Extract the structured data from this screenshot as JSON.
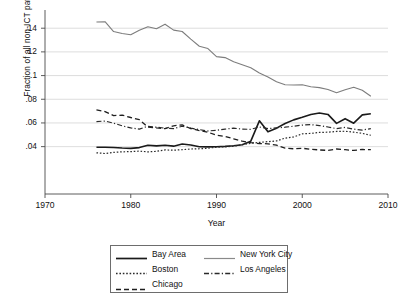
{
  "chart_data": {
    "type": "line",
    "title": "",
    "subtitle": "",
    "xlabel": "Year",
    "ylabel": "Fraction of all non-ICT patents in location",
    "xlim": [
      1970,
      2010
    ],
    "ylim": [
      0,
      0.152
    ],
    "xticks": [
      1970,
      1980,
      1990,
      2000,
      2010
    ],
    "xticklabels": [
      "1970",
      "1980",
      "1990",
      "2000",
      "2010"
    ],
    "yticks": [
      0.04,
      0.06,
      0.08,
      0.1,
      0.12,
      0.14
    ],
    "yticklabels": [
      ".04",
      ".06",
      ".08",
      ".1",
      ".12",
      ".14"
    ],
    "grid": "horizontal",
    "legend_position": "below-center",
    "x": [
      1976,
      1977,
      1978,
      1979,
      1980,
      1981,
      1982,
      1983,
      1984,
      1985,
      1986,
      1987,
      1988,
      1989,
      1990,
      1991,
      1992,
      1993,
      1994,
      1995,
      1996,
      1997,
      1998,
      1999,
      2000,
      2001,
      2002,
      2003,
      2004,
      2005,
      2006,
      2007,
      2008
    ],
    "series": [
      {
        "name": "Bay Area",
        "style": "solid",
        "color": "#1a1a1a",
        "width": 1.6,
        "values": [
          0.0395,
          0.0395,
          0.0393,
          0.0388,
          0.0385,
          0.0392,
          0.0412,
          0.0406,
          0.0412,
          0.0404,
          0.0422,
          0.0414,
          0.0399,
          0.0398,
          0.0399,
          0.0402,
          0.0408,
          0.0416,
          0.0446,
          0.0618,
          0.0525,
          0.0556,
          0.0595,
          0.0626,
          0.0648,
          0.0672,
          0.0684,
          0.0672,
          0.0596,
          0.0636,
          0.0598,
          0.0668,
          0.0678
        ]
      },
      {
        "name": "New York City",
        "style": "solid",
        "color": "#7d7d7d",
        "width": 1.1,
        "values": [
          0.1452,
          0.1455,
          0.1372,
          0.1355,
          0.1345,
          0.1383,
          0.1412,
          0.1396,
          0.1434,
          0.1384,
          0.1372,
          0.1308,
          0.1248,
          0.1228,
          0.116,
          0.1152,
          0.1116,
          0.1092,
          0.1066,
          0.1022,
          0.0988,
          0.0948,
          0.0922,
          0.092,
          0.0922,
          0.0906,
          0.0898,
          0.0882,
          0.0855,
          0.088,
          0.0902,
          0.0876,
          0.0825
        ]
      },
      {
        "name": "Boston",
        "style": "dotted",
        "color": "#2a2a2a",
        "width": 1.2,
        "values": [
          0.0348,
          0.0342,
          0.0352,
          0.0356,
          0.0358,
          0.0362,
          0.0356,
          0.036,
          0.0372,
          0.037,
          0.0374,
          0.038,
          0.0382,
          0.0386,
          0.0396,
          0.0398,
          0.0404,
          0.0416,
          0.0428,
          0.0436,
          0.0442,
          0.0448,
          0.0472,
          0.0482,
          0.0508,
          0.0512,
          0.052,
          0.0522,
          0.0528,
          0.053,
          0.0522,
          0.0512,
          0.0496
        ]
      },
      {
        "name": "Los Angeles",
        "style": "dashdot",
        "color": "#2a2a2a",
        "width": 1.2,
        "values": [
          0.0612,
          0.0616,
          0.0598,
          0.0576,
          0.0558,
          0.0548,
          0.0572,
          0.0564,
          0.0556,
          0.0552,
          0.0572,
          0.0556,
          0.0544,
          0.0532,
          0.0538,
          0.0548,
          0.0556,
          0.0548,
          0.0546,
          0.0566,
          0.0552,
          0.0558,
          0.0564,
          0.0572,
          0.0582,
          0.0586,
          0.0578,
          0.0566,
          0.0552,
          0.0562,
          0.0548,
          0.054,
          0.0552
        ]
      },
      {
        "name": "Chicago",
        "style": "dashed",
        "color": "#1f1f1f",
        "width": 1.3,
        "values": [
          0.071,
          0.0696,
          0.0662,
          0.0666,
          0.0646,
          0.0628,
          0.0566,
          0.0558,
          0.0552,
          0.0576,
          0.0584,
          0.0552,
          0.0536,
          0.0522,
          0.0496,
          0.0486,
          0.0466,
          0.0446,
          0.0434,
          0.0426,
          0.0424,
          0.0412,
          0.0388,
          0.0382,
          0.0386,
          0.0378,
          0.0372,
          0.0368,
          0.038,
          0.0374,
          0.0368,
          0.0376,
          0.0374
        ]
      }
    ]
  },
  "axis": {
    "ylabel": "Fraction of all non-ICT patents in location",
    "xlabel": "Year",
    "yticklabels": [
      ".14",
      ".12",
      ".1",
      ".08",
      ".06",
      ".04"
    ],
    "xticklabels": [
      "1970",
      "1980",
      "1990",
      "2000",
      "2010"
    ]
  },
  "legend": {
    "entries": [
      {
        "label": "Bay Area",
        "style": "solid-thick"
      },
      {
        "label": "New York City",
        "style": "solid-gray"
      },
      {
        "label": "Boston",
        "style": "dotted"
      },
      {
        "label": "Los Angeles",
        "style": "dashdot"
      },
      {
        "label": "Chicago",
        "style": "dashed"
      }
    ]
  },
  "colors": {
    "axis": "#4a4a4a",
    "grid": "#cfcfcf",
    "bay_area": "#1a1a1a",
    "new_york_city": "#7d7d7d",
    "boston": "#2a2a2a",
    "los_angeles": "#2a2a2a",
    "chicago": "#1f1f1f"
  }
}
